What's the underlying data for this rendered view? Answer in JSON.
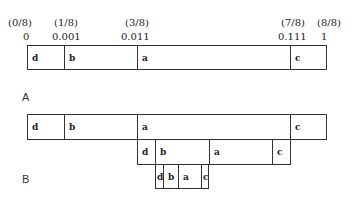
{
  "axis": {
    "fractions": [
      {
        "text": "(0/8)",
        "x": 8
      },
      {
        "text": "(1/8)",
        "x": 54
      },
      {
        "text": "(3/8)",
        "x": 125
      },
      {
        "text": "(7/8)",
        "x": 281
      },
      {
        "text": "(8/8)",
        "x": 317
      }
    ],
    "values": [
      {
        "text": "0",
        "x": 23
      },
      {
        "text": "0.001",
        "x": 52
      },
      {
        "text": "0.011",
        "x": 121
      },
      {
        "text": "0.111",
        "x": 278
      },
      {
        "text": "1",
        "x": 321
      }
    ]
  },
  "panels": {
    "A": {
      "label": "A"
    },
    "B": {
      "label": "B"
    }
  },
  "boxes": [
    {
      "name": "panel-a-interval",
      "x": 27,
      "y": 45,
      "w": 300,
      "h": 25,
      "cells": [
        {
          "label": "d",
          "w": 37
        },
        {
          "label": "b",
          "w": 73
        },
        {
          "label": "a",
          "w": 153
        },
        {
          "label": "c",
          "w": 37
        }
      ]
    },
    {
      "name": "panel-b-level-1",
      "x": 27,
      "y": 114,
      "w": 300,
      "h": 26,
      "cells": [
        {
          "label": "d",
          "w": 37
        },
        {
          "label": "b",
          "w": 73
        },
        {
          "label": "a",
          "w": 153
        },
        {
          "label": "c",
          "w": 37
        }
      ]
    },
    {
      "name": "panel-b-level-2",
      "x": 137,
      "y": 139,
      "w": 154,
      "h": 26,
      "cells": [
        {
          "label": "d",
          "w": 18
        },
        {
          "label": "b",
          "w": 54
        },
        {
          "label": "a",
          "w": 63
        },
        {
          "label": "c",
          "w": 19
        }
      ]
    },
    {
      "name": "panel-b-level-3",
      "x": 155,
      "y": 164,
      "w": 54,
      "h": 25,
      "cells": [
        {
          "label": "d",
          "w": 8
        },
        {
          "label": "b",
          "w": 15
        },
        {
          "label": "a",
          "w": 23
        },
        {
          "label": "c",
          "w": 8
        }
      ]
    }
  ]
}
